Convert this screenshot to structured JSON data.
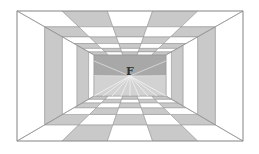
{
  "figure": {
    "center_label": "F",
    "outer_rect": {
      "x1": 17,
      "y1": 11,
      "x2": 243,
      "y2": 141
    },
    "inner_rect": {
      "x1": 94,
      "y1": 55,
      "x2": 166,
      "y2": 96
    },
    "vanishing_point": {
      "x": 130,
      "y": 76
    },
    "depth_rows": [
      0,
      0.36,
      0.59,
      0.74,
      0.85,
      0.93,
      1.0
    ],
    "columns": 5,
    "wall_bands": [
      {
        "t0": 0.0,
        "t1": 0.36,
        "shade": "white"
      },
      {
        "t0": 0.36,
        "t1": 0.59,
        "shade": "gray"
      },
      {
        "t0": 0.59,
        "t1": 0.78,
        "shade": "white"
      },
      {
        "t0": 0.78,
        "t1": 0.93,
        "shade": "gray"
      },
      {
        "t0": 0.93,
        "t1": 1.0,
        "shade": "white"
      }
    ],
    "ray_count": 9,
    "colors": {
      "white": "#ffffff",
      "gray": "#c9c9c9",
      "line": "#8e8e8e",
      "back_wall_top": "#a8a8a8",
      "back_wall_bottom": "#d2d2d2",
      "ray": "#f2f2f2",
      "label": "#333333"
    }
  }
}
